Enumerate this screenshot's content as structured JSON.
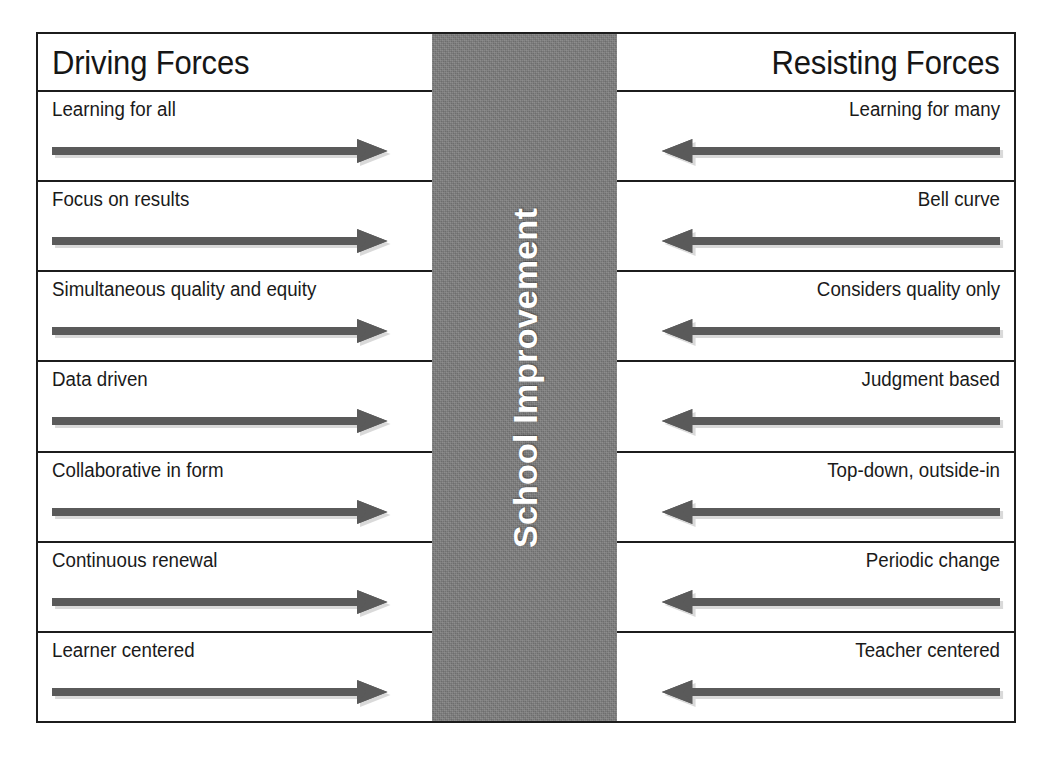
{
  "diagram": {
    "center_band": {
      "label": "School Improvement",
      "text_color": "#ffffff",
      "background_color": "#7d7d7d"
    },
    "arrow_color": "#5a5a5a",
    "border_color": "#1c1c1c",
    "left": {
      "header": "Driving Forces",
      "direction": "right",
      "items": [
        {
          "label": "Learning for all",
          "arrow": "arrow-right-icon"
        },
        {
          "label": "Focus on results",
          "arrow": "arrow-right-icon"
        },
        {
          "label": "Simultaneous quality and equity",
          "arrow": "arrow-right-icon"
        },
        {
          "label": "Data driven",
          "arrow": "arrow-right-icon"
        },
        {
          "label": "Collaborative in form",
          "arrow": "arrow-right-icon"
        },
        {
          "label": "Continuous renewal",
          "arrow": "arrow-right-icon"
        },
        {
          "label": "Learner centered",
          "arrow": "arrow-right-icon"
        }
      ]
    },
    "right": {
      "header": "Resisting Forces",
      "direction": "left",
      "items": [
        {
          "label": "Learning for many",
          "arrow": "arrow-left-icon"
        },
        {
          "label": "Bell curve",
          "arrow": "arrow-left-icon"
        },
        {
          "label": "Considers quality only",
          "arrow": "arrow-left-icon"
        },
        {
          "label": "Judgment based",
          "arrow": "arrow-left-icon"
        },
        {
          "label": "Top-down, outside-in",
          "arrow": "arrow-left-icon"
        },
        {
          "label": "Periodic change",
          "arrow": "arrow-left-icon"
        },
        {
          "label": "Teacher centered",
          "arrow": "arrow-left-icon"
        }
      ]
    }
  }
}
